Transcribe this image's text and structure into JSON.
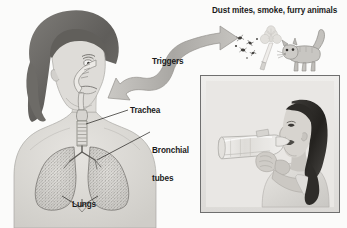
{
  "figure": {
    "kind": "educational-medical-illustration",
    "background_color": "#fbfbfa",
    "width": 347,
    "height": 228
  },
  "labels": {
    "triggers_list": "Dust mites, smoke, furry animals",
    "triggers": "Triggers",
    "trachea": "Trachea",
    "bronchial_line1": "Bronchial",
    "bronchial_line2": "tubes",
    "lungs": "Lungs"
  },
  "diagram": {
    "person": {
      "name": "woman-respiratory-cutaway",
      "description": "Head and upper torso of a woman with dark curly hair shown in three-quarter view, with a cutaway of the nasal passage, throat, trachea and lungs",
      "hair_color": "#6d6b68",
      "skin_color": "#d9d7d3",
      "outline_color": "#8a8782"
    },
    "airway": {
      "trachea_color": "#cfcdc9",
      "lung_fill": "#d8d6d2",
      "lung_stipple_color": "#6e6c68"
    },
    "arrow": {
      "name": "double-headed-trigger-arrow",
      "description": "Curved S-shaped double-headed arrow linking the triggers to the person's airway",
      "color": "#b5b3af",
      "edge_color": "#8f8d89"
    }
  },
  "triggers": [
    {
      "id": "dust-mites",
      "label": "Dust mites",
      "icon": "dust-mites-icon",
      "color": "#4a4845"
    },
    {
      "id": "smoke",
      "label": "smoke",
      "icon": "cigarette-smoke-icon",
      "color": "#d6d4d0"
    },
    {
      "id": "furry-animals",
      "label": "furry animals",
      "icon": "cat-icon",
      "color": "#b8b6b2"
    }
  ],
  "photo": {
    "name": "girl-using-inhaler-photo",
    "caption_visible": false,
    "description": "Black-and-white photograph of a young girl in profile holding an inhaler with a spacer chamber to her mouth",
    "frame_color": "#6f6f6f",
    "mat_color": "#e9e8e6",
    "subject": "girl",
    "device": "inhaler-with-spacer"
  }
}
